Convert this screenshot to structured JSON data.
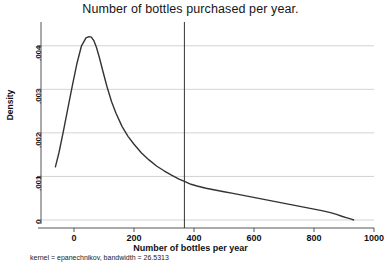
{
  "chart_data": {
    "type": "line",
    "title": "Number of bottles purchased per year.",
    "subtitle": "",
    "xlabel": "Number of bottles per year",
    "ylabel": "Density",
    "note": "kernel = epanechnikov, bandwidth = 26.5313",
    "xlim": [
      -110,
      1000
    ],
    "ylim": [
      0,
      0.0045
    ],
    "xticks": [
      0,
      200,
      400,
      600,
      800,
      1000
    ],
    "xtick_labels": [
      "0",
      "200",
      "400",
      "600",
      "800",
      "1000"
    ],
    "yticks": [
      0,
      0.001,
      0.002,
      0.003,
      0.004
    ],
    "ytick_labels": [
      "0",
      ".001",
      ".002",
      ".003",
      ".004"
    ],
    "grid": "horizontal",
    "legend": "none",
    "line_color": "#333333",
    "grid_color": "#c8c8c8",
    "axis_color": "#555555",
    "series": [
      {
        "name": "Kernel density",
        "x": [
          -62,
          -50,
          -35,
          -20,
          -5,
          10,
          25,
          40,
          50,
          58,
          66,
          75,
          85,
          95,
          110,
          125,
          140,
          160,
          180,
          200,
          225,
          250,
          275,
          300,
          325,
          350,
          370,
          390,
          410,
          440,
          470,
          500,
          530,
          560,
          590,
          620,
          650,
          680,
          710,
          740,
          770,
          800,
          830,
          855,
          875,
          895,
          910,
          925,
          932
        ],
        "y": [
          0.00122,
          0.00155,
          0.00205,
          0.00258,
          0.0031,
          0.0036,
          0.004,
          0.00418,
          0.00421,
          0.0042,
          0.00412,
          0.00396,
          0.00372,
          0.00345,
          0.00306,
          0.00272,
          0.00245,
          0.00215,
          0.00192,
          0.00174,
          0.00154,
          0.00138,
          0.00124,
          0.00113,
          0.00103,
          0.00094,
          0.00088,
          0.00082,
          0.00078,
          0.00073,
          0.00069,
          0.00065,
          0.00061,
          0.00057,
          0.00053,
          0.00049,
          0.00045,
          0.00041,
          0.00037,
          0.00033,
          0.00029,
          0.00025,
          0.00021,
          0.00017,
          0.00013,
          8e-05,
          5e-05,
          2e-05,
          0.0
        ]
      }
    ],
    "reference_line": {
      "name": "vertical-reference-line",
      "orientation": "vertical",
      "x": 368
    }
  }
}
